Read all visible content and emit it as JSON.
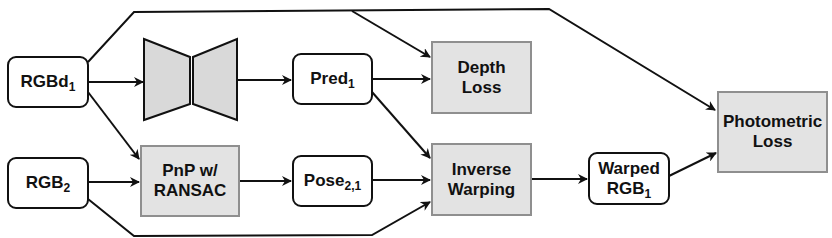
{
  "diagram": {
    "colors": {
      "line": "#111111",
      "process_fill": "#e3e3e3",
      "process_border": "#8f8f8f",
      "data_fill": "#ffffff",
      "network_fill": "#d9d9d9"
    },
    "nodes": {
      "rgbd1": {
        "base": "RGBd",
        "sub": "1"
      },
      "rgb2": {
        "base": "RGB",
        "sub": "2"
      },
      "network": {
        "icon": "encoder-decoder-icon"
      },
      "pnp": {
        "line1": "PnP w/",
        "line2": "RANSAC"
      },
      "pred1": {
        "base": "Pred",
        "sub": "1"
      },
      "pose21": {
        "base": "Pose",
        "sub": "2,1"
      },
      "depth_loss": {
        "line1": "Depth",
        "line2": "Loss"
      },
      "inverse_warping": {
        "line1": "Inverse",
        "line2": "Warping"
      },
      "warped_rgb1": {
        "line1": "Warped",
        "base": "RGB",
        "sub": "1"
      },
      "photometric_loss": {
        "line1": "Photometric",
        "line2": "Loss"
      }
    },
    "edges": [
      [
        "RGBd1",
        "Network"
      ],
      [
        "Network",
        "Pred1"
      ],
      [
        "Pred1",
        "Depth Loss"
      ],
      [
        "RGBd1",
        "Depth Loss"
      ],
      [
        "RGBd1",
        "Photometric Loss"
      ],
      [
        "RGBd1",
        "PnP w/ RANSAC"
      ],
      [
        "RGB2",
        "PnP w/ RANSAC"
      ],
      [
        "PnP w/ RANSAC",
        "Pose2,1"
      ],
      [
        "Pose2,1",
        "Inverse Warping"
      ],
      [
        "Pred1",
        "Inverse Warping"
      ],
      [
        "RGB2",
        "Inverse Warping"
      ],
      [
        "Inverse Warping",
        "Warped RGB1"
      ],
      [
        "Warped RGB1",
        "Photometric Loss"
      ]
    ]
  }
}
